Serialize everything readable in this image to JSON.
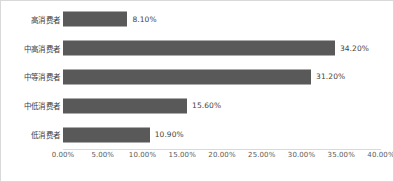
{
  "chart_data": {
    "type": "bar",
    "orientation": "horizontal",
    "title": "",
    "subtitle": "",
    "xlabel": "",
    "ylabel": "",
    "xlim": [
      0,
      40
    ],
    "grid": false,
    "legend": null,
    "bar_color": "#595959",
    "background_color": "#FFFFFF",
    "border_color": "#D9D9D9",
    "categories": [
      "高消费者",
      "中高消费者",
      "中等消费者",
      "中低消费者",
      "低消费者"
    ],
    "values": [
      8.1,
      34.2,
      31.2,
      15.6,
      10.9
    ],
    "value_labels": [
      "8.10%",
      "34.20%",
      "31.20%",
      "15.60%",
      "10.90%"
    ],
    "tick_values": [
      0,
      5,
      10,
      15,
      20,
      25,
      30,
      35,
      40
    ],
    "tick_labels": [
      "0.00%",
      "5.00%",
      "10.00%",
      "15.00%",
      "20.00%",
      "25.00%",
      "30.00%",
      "35.00%",
      "40.00%"
    ]
  }
}
